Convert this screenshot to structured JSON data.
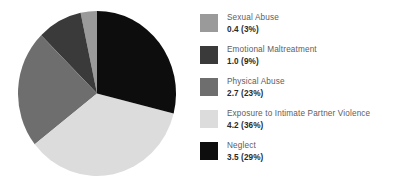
{
  "chart_data": {
    "type": "pie",
    "title": "",
    "subtitle": "",
    "xlabel": "",
    "ylabel": "",
    "legend_position": "right",
    "grid": false,
    "units": "millions",
    "start_angle_deg": 0,
    "direction": "clockwise",
    "categories": [
      "Sexual Abuse",
      "Emotional Maltreatment",
      "Physical Abuse",
      "Exposure to Intimate Partner Violence",
      "Neglect"
    ],
    "values": [
      0.4,
      1.0,
      2.7,
      4.2,
      3.5
    ],
    "percentages": [
      3,
      9,
      23,
      36,
      29
    ],
    "colors": [
      "#9a9a9a",
      "#3a3a3a",
      "#6e6e6e",
      "#dcdcdc",
      "#0d0d0d"
    ],
    "slices": [
      {
        "label": "Sexual Abuse",
        "value": 0.4,
        "percent": 3,
        "value_text": "0.4 (3%)",
        "color": "#9a9a9a",
        "start_deg": 348,
        "end_deg": 360
      },
      {
        "label": "Emotional Maltreatment",
        "value": 1.0,
        "percent": 9,
        "value_text": "1.0 (9%)",
        "color": "#3a3a3a",
        "start_deg": 315,
        "end_deg": 348
      },
      {
        "label": "Physical Abuse",
        "value": 2.7,
        "percent": 23,
        "value_text": "2.7 (23%)",
        "color": "#6e6e6e",
        "start_deg": 232,
        "end_deg": 315
      },
      {
        "label": "Exposure to Intimate Partner Violence",
        "value": 4.2,
        "percent": 36,
        "value_text": "4.2 (36%)",
        "color": "#dcdcdc",
        "start_deg": 104,
        "end_deg": 232
      },
      {
        "label": "Neglect",
        "value": 3.5,
        "percent": 29,
        "value_text": "3.5 (29%)",
        "color": "#0d0d0d",
        "start_deg": 0,
        "end_deg": 104
      }
    ]
  },
  "legend": {
    "items": [
      {
        "label": "Sexual Abuse",
        "value_text": "0.4 (3%)",
        "color": "#9a9a9a"
      },
      {
        "label": "Emotional Maltreatment",
        "value_text": "1.0 (9%)",
        "color": "#3a3a3a"
      },
      {
        "label": "Physical Abuse",
        "value_text": "2.7 (23%)",
        "color": "#6e6e6e"
      },
      {
        "label": "Exposure to Intimate Partner Violence",
        "value_text": "4.2 (36%)",
        "color": "#dcdcdc"
      },
      {
        "label": "Neglect",
        "value_text": "3.5 (29%)",
        "color": "#0d0d0d"
      }
    ]
  }
}
